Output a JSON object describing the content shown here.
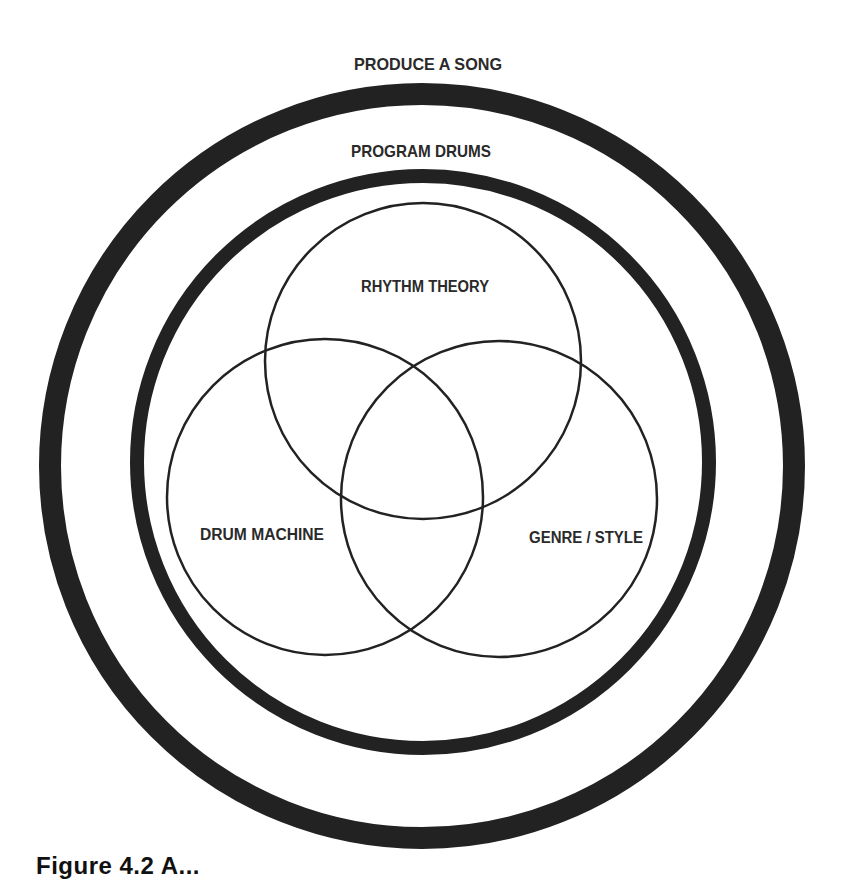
{
  "diagram": {
    "type": "nested-venn",
    "colors": {
      "stroke": "#222222",
      "text": "#2a2a2a",
      "background": "#ffffff"
    },
    "outer_ring": {
      "label": "PRODUCE A SONG",
      "cx": 422,
      "cy": 466,
      "r": 372,
      "stroke_width": 22
    },
    "inner_ring": {
      "label": "PROGRAM DRUMS",
      "cx": 423,
      "cy": 462,
      "r": 286,
      "stroke_width": 14
    },
    "venn_circles": [
      {
        "label": "RHYTHM THEORY",
        "cx": 423,
        "cy": 361,
        "r": 158
      },
      {
        "label": "DRUM MACHINE",
        "cx": 325,
        "cy": 497,
        "r": 158
      },
      {
        "label": "GENRE / STYLE",
        "cx": 499,
        "cy": 499,
        "r": 158
      }
    ]
  },
  "caption": {
    "text": "Figure 4.2  A..."
  }
}
